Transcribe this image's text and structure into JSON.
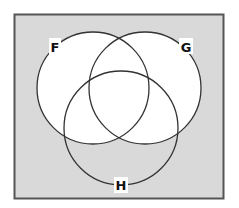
{
  "diagram": {
    "type": "venn",
    "sets": [
      {
        "label": "F",
        "cx": 93,
        "cy": 88,
        "r": 56,
        "label_x": 55,
        "label_y": 52
      },
      {
        "label": "G",
        "cx": 145,
        "cy": 88,
        "r": 56,
        "label_x": 186,
        "label_y": 52
      },
      {
        "label": "H",
        "cx": 121,
        "cy": 128,
        "r": 57,
        "label_x": 121,
        "label_y": 190
      }
    ],
    "shaded_region": "complement of (F ∪ G)",
    "colors": {
      "shade": "#d9d9d9",
      "unshaded": "#ffffff",
      "stroke": "#333333",
      "border": "#555555"
    },
    "universe": {
      "x": 14,
      "y": 14,
      "width": 209,
      "height": 184
    }
  }
}
